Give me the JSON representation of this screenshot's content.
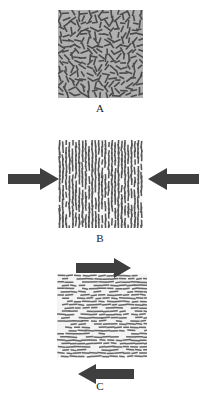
{
  "figure": {
    "background_color": "#ffffff",
    "arrow_color": "#3f3f3f",
    "label_color": "#1b1b1b"
  },
  "panels": [
    {
      "id": "A",
      "label": "A",
      "description": "Random particle orientation, no applied load",
      "specimen": {
        "background_color": "#b0b0b0",
        "dash_color": "#4a4a4a",
        "orientation": "random",
        "dash_count": 300,
        "dash_length": 7,
        "dash_thickness": 1.6
      },
      "arrows": []
    },
    {
      "id": "B",
      "label": "B",
      "description": "Vertical particle alignment under horizontal compression",
      "specimen": {
        "background_color": "#f7f7f7",
        "dash_color": "#555555",
        "orientation": "vertical",
        "columns": 26,
        "rows": 20,
        "dash_length": 7,
        "dash_thickness": 1.5
      },
      "arrows": [
        {
          "name": "compression-arrow-left",
          "direction": "right",
          "position": "left"
        },
        {
          "name": "compression-arrow-right",
          "direction": "left",
          "position": "right"
        }
      ]
    },
    {
      "id": "C",
      "label": "C",
      "description": "Horizontal particle alignment under shear loading",
      "specimen": {
        "background_color": "#f4f4f4",
        "dash_color": "#6a6a6a",
        "orientation": "horizontal",
        "columns": 11,
        "rows": 26,
        "dash_length": 7,
        "dash_thickness": 1.5
      },
      "arrows": [
        {
          "name": "shear-arrow-top",
          "direction": "right",
          "position": "top"
        },
        {
          "name": "shear-arrow-bottom",
          "direction": "left",
          "position": "bottom"
        }
      ]
    }
  ]
}
